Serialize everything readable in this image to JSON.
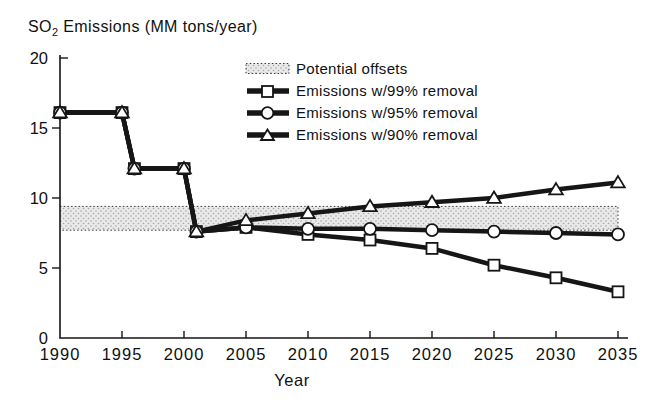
{
  "title": {
    "prefix": "SO",
    "sub": "2",
    "suffix": " Emissions (MM tons/year)"
  },
  "colors": {
    "ink": "#161616",
    "marker_fill": "#ffffff",
    "band_bg": "#e9e9e9",
    "band_dot": "#a6a6a6",
    "band_border": "#3a3a3a",
    "background": "#ffffff"
  },
  "legend": {
    "items": [
      {
        "label": "Potential offsets",
        "swatch": "band"
      },
      {
        "label": "Emissions w/99% removal",
        "swatch": "square"
      },
      {
        "label": "Emissions w/95% removal",
        "swatch": "circle"
      },
      {
        "label": "Emissions w/90% removal",
        "swatch": "triangle"
      }
    ]
  },
  "chart_data": {
    "type": "line",
    "title": "SO2 Emissions (MM tons/year)",
    "xlabel": "Year",
    "ylabel": "SO2 Emissions (MM tons/year)",
    "xlim": [
      1990,
      2035
    ],
    "ylim": [
      0,
      20
    ],
    "x_ticks": [
      1990,
      1995,
      2000,
      2005,
      2010,
      2015,
      2020,
      2025,
      2030,
      2035
    ],
    "y_ticks": [
      0,
      5,
      10,
      15,
      20
    ],
    "grid": false,
    "legend_position": "top-right",
    "band": {
      "label": "Potential offsets",
      "x_range": [
        1990,
        2035
      ],
      "y_range": [
        7.7,
        9.4
      ]
    },
    "series": [
      {
        "name": "Emissions w/99% removal",
        "marker": "square",
        "points": [
          [
            1990,
            16.1
          ],
          [
            1995,
            16.1
          ],
          [
            1996,
            12.1
          ],
          [
            2000,
            12.1
          ],
          [
            2001,
            7.6
          ],
          [
            2005,
            7.9
          ],
          [
            2010,
            7.4
          ],
          [
            2015,
            7.0
          ],
          [
            2020,
            6.4
          ],
          [
            2025,
            5.2
          ],
          [
            2030,
            4.3
          ],
          [
            2035,
            3.3
          ]
        ]
      },
      {
        "name": "Emissions w/95% removal",
        "marker": "circle",
        "points": [
          [
            1990,
            16.1
          ],
          [
            1995,
            16.1
          ],
          [
            1996,
            12.1
          ],
          [
            2000,
            12.1
          ],
          [
            2001,
            7.6
          ],
          [
            2005,
            7.9
          ],
          [
            2010,
            7.8
          ],
          [
            2015,
            7.8
          ],
          [
            2020,
            7.7
          ],
          [
            2025,
            7.6
          ],
          [
            2030,
            7.5
          ],
          [
            2035,
            7.4
          ]
        ]
      },
      {
        "name": "Emissions w/90% removal",
        "marker": "triangle",
        "points": [
          [
            1990,
            16.1
          ],
          [
            1995,
            16.1
          ],
          [
            1996,
            12.1
          ],
          [
            2000,
            12.1
          ],
          [
            2001,
            7.6
          ],
          [
            2005,
            8.4
          ],
          [
            2010,
            8.9
          ],
          [
            2015,
            9.4
          ],
          [
            2020,
            9.7
          ],
          [
            2025,
            10.0
          ],
          [
            2030,
            10.6
          ],
          [
            2035,
            11.1
          ]
        ]
      }
    ]
  }
}
